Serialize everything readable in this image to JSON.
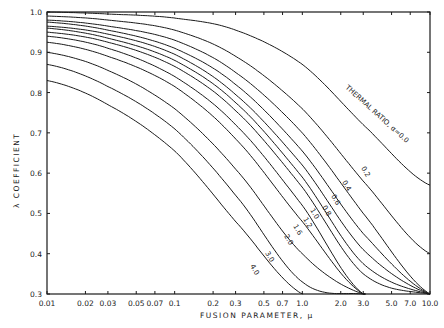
{
  "chart_data": {
    "type": "line",
    "title": "",
    "xlabel": "FUSION PARAMETER, μ",
    "ylabel": "λ COEFFICIENT",
    "xscale": "log",
    "xlim": [
      0.01,
      10.0
    ],
    "ylim": [
      0.3,
      1.0
    ],
    "grid": false,
    "legend": "inline curve labels",
    "x_ticks": [
      0.01,
      0.02,
      0.03,
      0.05,
      0.07,
      0.1,
      0.2,
      0.3,
      0.5,
      0.7,
      1.0,
      2.0,
      3.0,
      5.0,
      7.0,
      10.0
    ],
    "x_tick_labels": [
      "0.01",
      "0.02",
      "0.03",
      "0.05",
      "0.07",
      "0.1",
      "0.2",
      "0.3",
      "0.5",
      "0.7",
      "1.0",
      "2.0",
      "3.0",
      "5.0",
      "7.0",
      "10.0"
    ],
    "y_ticks": [
      0.3,
      0.4,
      0.5,
      0.6,
      0.7,
      0.8,
      0.9,
      1.0
    ],
    "y_tick_labels": [
      "0.3",
      "0.4",
      "0.5",
      "0.6",
      "0.7",
      "0.8",
      "0.9",
      "1.0"
    ],
    "x": [
      0.01,
      0.03,
      0.1,
      0.3,
      1.0,
      3.0,
      10.0
    ],
    "series": [
      {
        "name": "THERMAL RATIO, α=0.0",
        "label": "THERMAL RATIO, α=0.0",
        "values": [
          1.0,
          0.995,
          0.985,
          0.955,
          0.87,
          0.72,
          0.57
        ]
      },
      {
        "name": "0.2",
        "label": "0.2",
        "values": [
          0.99,
          0.98,
          0.955,
          0.89,
          0.76,
          0.58,
          0.4
        ]
      },
      {
        "name": "0.4",
        "label": "0.4",
        "values": [
          0.98,
          0.965,
          0.93,
          0.85,
          0.7,
          0.5,
          0.3
        ]
      },
      {
        "name": "0.6",
        "label": "0.6",
        "values": [
          0.975,
          0.955,
          0.91,
          0.82,
          0.655,
          0.45,
          0.3
        ]
      },
      {
        "name": "0.8",
        "label": "0.8",
        "values": [
          0.965,
          0.945,
          0.895,
          0.795,
          0.62,
          0.41,
          0.3
        ]
      },
      {
        "name": "1.0",
        "label": "1.0",
        "values": [
          0.96,
          0.935,
          0.88,
          0.775,
          0.59,
          0.375,
          0.3
        ]
      },
      {
        "name": "1.2",
        "label": "1.2",
        "values": [
          0.95,
          0.925,
          0.865,
          0.755,
          0.565,
          0.35,
          0.3
        ]
      },
      {
        "name": "1.6",
        "label": "1.6",
        "values": [
          0.94,
          0.91,
          0.84,
          0.72,
          0.52,
          0.3,
          0.3
        ]
      },
      {
        "name": "2.0",
        "label": "2.0",
        "values": [
          0.925,
          0.89,
          0.815,
          0.685,
          0.48,
          0.3,
          0.3
        ]
      },
      {
        "name": "3.0",
        "label": "3.0",
        "values": [
          0.9,
          0.855,
          0.76,
          0.61,
          0.4,
          0.3,
          0.3
        ]
      },
      {
        "name": "4.0",
        "label": "4.0",
        "values": [
          0.87,
          0.815,
          0.71,
          0.545,
          0.33,
          0.3,
          0.3
        ]
      },
      {
        "name": "extra",
        "label": "",
        "values": [
          0.83,
          0.77,
          0.655,
          0.48,
          0.3,
          0.3,
          0.3
        ]
      }
    ],
    "annotations": [
      {
        "text": "THERMAL RATIO, α=0.0",
        "near_curve": "0.0"
      },
      {
        "text": "0.2"
      },
      {
        "text": "0.4"
      },
      {
        "text": "0.6"
      },
      {
        "text": "0.8"
      },
      {
        "text": "1.0"
      },
      {
        "text": "1.2"
      },
      {
        "text": "1.6"
      },
      {
        "text": "2.0"
      },
      {
        "text": "3.0"
      },
      {
        "text": "4.0"
      }
    ]
  },
  "labels": {
    "xlabel": "FUSION   PARAMETER,  μ",
    "ylabel": "λ  COEFFICIENT",
    "thermal": "THERMAL  RATIO, α=0.0"
  }
}
